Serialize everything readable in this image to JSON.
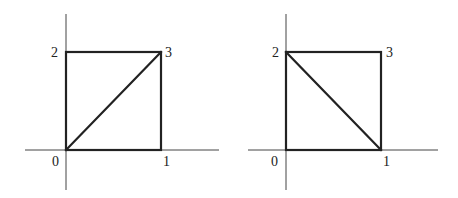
{
  "diagrams": [
    {
      "name": "left-square",
      "vertex_labels": {
        "v0": "0",
        "v1": "1",
        "v2": "2",
        "v3": "3"
      },
      "diagonal": "0-3"
    },
    {
      "name": "right-square",
      "vertex_labels": {
        "v0": "0",
        "v1": "1",
        "v2": "2",
        "v3": "3"
      },
      "diagonal": "2-1"
    }
  ],
  "colors": {
    "line": "#222222",
    "axis": "#444444",
    "background": "#ffffff"
  }
}
